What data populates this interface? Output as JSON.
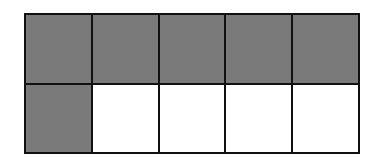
{
  "diagram": {
    "type": "fraction-grid",
    "rows": 2,
    "columns": 5,
    "shaded_count": 6,
    "total_count": 10,
    "colors": {
      "shaded": "#7a7a7a",
      "unshaded": "#ffffff",
      "border": "#111111"
    },
    "cells": [
      [
        true,
        true,
        true,
        true,
        true
      ],
      [
        true,
        false,
        false,
        false,
        false
      ]
    ]
  }
}
